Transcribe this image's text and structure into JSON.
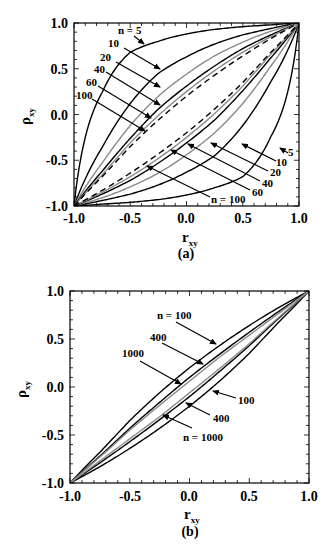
{
  "chart_data": [
    {
      "panel": "(a)",
      "type": "line",
      "title": "",
      "xlabel": "r_xy",
      "ylabel": "ρ_xy",
      "xlim": [
        -1.0,
        1.0
      ],
      "ylim": [
        -1.0,
        1.0
      ],
      "xticks": [
        "-1.0",
        "-0.5",
        "0.0",
        "0.5",
        "1.0"
      ],
      "yticks": [
        "-1.0",
        "-0.5",
        "0.0",
        "0.5",
        "1.0"
      ],
      "grid": false,
      "description": "95% confidence bounds of population correlation vs sample correlation (Fisher z), upper and lower curves per n",
      "x": [
        -1.0,
        -0.75,
        -0.5,
        -0.25,
        0.0,
        0.25,
        0.5,
        0.75,
        1.0
      ],
      "series": [
        {
          "name": "n = 5",
          "style": "black",
          "upper": [
            -1.0,
            0.24,
            0.68,
            0.8,
            0.88,
            0.93,
            0.96,
            0.98,
            1.0
          ],
          "lower": [
            -1.0,
            -0.98,
            -0.96,
            -0.93,
            -0.88,
            -0.8,
            -0.68,
            -0.24,
            1.0
          ]
        },
        {
          "name": "10",
          "style": "black",
          "upper": [
            -1.0,
            -0.36,
            0.12,
            0.45,
            0.63,
            0.77,
            0.87,
            0.94,
            1.0
          ],
          "lower": [
            -1.0,
            -0.94,
            -0.87,
            -0.77,
            -0.63,
            -0.45,
            -0.12,
            0.36,
            1.0
          ]
        },
        {
          "name": "20",
          "style": "gray",
          "upper": [
            -1.0,
            -0.53,
            -0.12,
            0.2,
            0.44,
            0.64,
            0.79,
            0.91,
            1.0
          ],
          "lower": [
            -1.0,
            -0.91,
            -0.79,
            -0.64,
            -0.44,
            -0.2,
            0.12,
            0.53,
            1.0
          ]
        },
        {
          "name": "40",
          "style": "black",
          "upper": [
            -1.0,
            -0.62,
            -0.26,
            0.06,
            0.31,
            0.53,
            0.72,
            0.87,
            1.0
          ],
          "lower": [
            -1.0,
            -0.87,
            -0.72,
            -0.53,
            -0.31,
            -0.06,
            0.26,
            0.62,
            1.0
          ]
        },
        {
          "name": "60",
          "style": "gray",
          "upper": [
            -1.0,
            -0.66,
            -0.31,
            -0.01,
            0.25,
            0.48,
            0.68,
            0.85,
            1.0
          ],
          "lower": [
            -1.0,
            -0.85,
            -0.68,
            -0.48,
            -0.25,
            0.01,
            0.31,
            0.66,
            1.0
          ]
        },
        {
          "name": "n = 100",
          "style": "dashed",
          "upper": [
            -1.0,
            -0.68,
            -0.35,
            -0.06,
            0.2,
            0.43,
            0.64,
            0.83,
            1.0
          ],
          "lower": [
            -1.0,
            -0.83,
            -0.64,
            -0.43,
            -0.2,
            0.06,
            0.35,
            0.68,
            1.0
          ]
        }
      ]
    },
    {
      "panel": "(b)",
      "type": "line",
      "title": "",
      "xlabel": "r_xy",
      "ylabel": "ρ_xy",
      "xlim": [
        -1.0,
        1.0
      ],
      "ylim": [
        -1.0,
        1.0
      ],
      "xticks": [
        "-1.0",
        "-0.5",
        "0.0",
        "0.5",
        "1.0"
      ],
      "yticks": [
        "-1.0",
        "-0.5",
        "0.0",
        "0.5",
        "1.0"
      ],
      "grid": false,
      "x": [
        -1.0,
        -0.75,
        -0.5,
        -0.25,
        0.0,
        0.25,
        0.5,
        0.75,
        1.0
      ],
      "series": [
        {
          "name": "n = 100",
          "style": "black",
          "upper": [
            -1.0,
            -0.68,
            -0.35,
            -0.06,
            0.2,
            0.43,
            0.64,
            0.83,
            1.0
          ],
          "lower": [
            -1.0,
            -0.83,
            -0.64,
            -0.43,
            -0.2,
            0.06,
            0.35,
            0.68,
            1.0
          ]
        },
        {
          "name": "400",
          "style": "black",
          "upper": [
            -1.0,
            -0.72,
            -0.43,
            -0.16,
            0.1,
            0.34,
            0.57,
            0.79,
            1.0
          ],
          "lower": [
            -1.0,
            -0.79,
            -0.57,
            -0.34,
            -0.1,
            0.16,
            0.43,
            0.72,
            1.0
          ]
        },
        {
          "name": "1000",
          "style": "gray",
          "upper": [
            -1.0,
            -0.73,
            -0.45,
            -0.19,
            0.06,
            0.31,
            0.54,
            0.77,
            1.0
          ],
          "lower": [
            -1.0,
            -0.77,
            -0.54,
            -0.31,
            -0.06,
            0.19,
            0.45,
            0.73,
            1.0
          ]
        }
      ]
    }
  ],
  "panels": {
    "a": {
      "caption": "(a)",
      "xlabel_main": "r",
      "xlabel_sub": "xy",
      "ylabel_main": "ρ",
      "ylabel_sub": "xy",
      "ticks": [
        "-1.0",
        "-0.5",
        "0.0",
        "0.5",
        "1.0"
      ],
      "annotations_left": [
        "n = 5",
        "10",
        "20",
        "40",
        "60",
        "100"
      ],
      "annotations_right": [
        "5",
        "10",
        "20",
        "40",
        "60",
        "n = 100"
      ]
    },
    "b": {
      "caption": "(b)",
      "xlabel_main": "r",
      "xlabel_sub": "xy",
      "ylabel_main": "ρ",
      "ylabel_sub": "xy",
      "ticks": [
        "-1.0",
        "-0.5",
        "0.0",
        "0.5",
        "1.0"
      ],
      "annotations_left": [
        "n = 100",
        "400",
        "1000"
      ],
      "annotations_right": [
        "100",
        "400",
        "n = 1000"
      ]
    }
  }
}
